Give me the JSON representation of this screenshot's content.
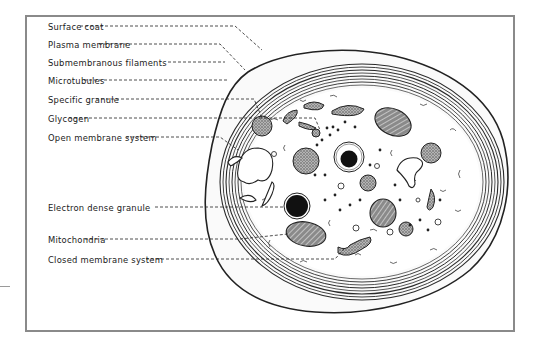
{
  "figure": {
    "labels": [
      {
        "text": "Surface coat",
        "y": 22
      },
      {
        "text": "Plasma membrane",
        "y": 40
      },
      {
        "text": "Submembranous filaments",
        "y": 58
      },
      {
        "text": "Microtubules",
        "y": 76
      },
      {
        "text": "Specific granule",
        "y": 95
      },
      {
        "text": "Glycogen",
        "y": 114
      },
      {
        "text": "Open membrane system",
        "y": 133
      },
      {
        "text": "Electron dense granule",
        "y": 203
      },
      {
        "text": "Mitochondria",
        "y": 235
      },
      {
        "text": "Closed membrane system",
        "y": 255
      }
    ],
    "colors": {
      "ink": "#1a1a1a",
      "frame": "#8a8a8a",
      "granule_fill": "#8c8c8c",
      "dense_core": "#111111"
    }
  }
}
